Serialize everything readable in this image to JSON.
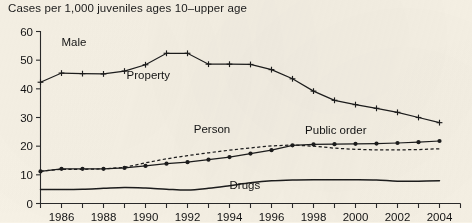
{
  "chart_data": {
    "type": "line",
    "title": "Cases per 1,000 juveniles ages 10–upper age",
    "subtitle": "Male",
    "xlabel": "",
    "ylabel": "",
    "xlim": [
      1985,
      2005
    ],
    "ylim": [
      0,
      60
    ],
    "yticks": [
      0,
      10,
      20,
      30,
      40,
      50,
      60
    ],
    "ytick_labels": [
      "0",
      "10",
      "20",
      "30",
      "40",
      "50",
      "60"
    ],
    "xticks": [
      1985,
      1986,
      1987,
      1988,
      1989,
      1990,
      1991,
      1992,
      1993,
      1994,
      1995,
      1996,
      1997,
      1998,
      1999,
      2000,
      2001,
      2002,
      2003,
      2004,
      2005
    ],
    "xtick_labels_shown": [
      "1986",
      "1988",
      "1990",
      "1992",
      "1994",
      "1996",
      "1998",
      "2000",
      "2002",
      "2004"
    ],
    "xtick_labels_years": [
      1986,
      1988,
      1990,
      1992,
      1994,
      1996,
      1998,
      2000,
      2002,
      2004
    ],
    "grid": false,
    "legend": "inline-annotations",
    "x": [
      1985,
      1986,
      1987,
      1988,
      1989,
      1990,
      1991,
      1992,
      1993,
      1994,
      1995,
      1996,
      1997,
      1998,
      1999,
      2000,
      2001,
      2002,
      2003,
      2004
    ],
    "series": [
      {
        "name": "Property",
        "label": "Property",
        "style": "solid",
        "marker": "plus",
        "label_x": 1989.1,
        "label_y": 43.5,
        "values": [
          42.3,
          45.5,
          45.3,
          45.2,
          46.2,
          48.4,
          52.4,
          52.4,
          48.6,
          48.6,
          48.5,
          46.7,
          43.5,
          39.2,
          36.0,
          34.5,
          33.2,
          31.8,
          30.0,
          28.2
        ]
      },
      {
        "name": "Person",
        "label": "Person",
        "style": "dashed",
        "marker": "none",
        "label_x": 1992.3,
        "label_y": 24.6,
        "values": [
          11.3,
          11.9,
          11.9,
          12.1,
          12.6,
          14.2,
          15.6,
          16.7,
          17.7,
          18.6,
          19.4,
          20.1,
          20.4,
          20.0,
          19.3,
          18.9,
          18.7,
          18.7,
          18.8,
          19.1
        ]
      },
      {
        "name": "Public order",
        "label": "Public order",
        "style": "solid",
        "marker": "dot",
        "label_x": 1997.6,
        "label_y": 24.3,
        "values": [
          11.2,
          12.1,
          12.1,
          12.1,
          12.4,
          13.1,
          13.9,
          14.4,
          15.3,
          16.2,
          17.4,
          18.6,
          20.3,
          20.6,
          20.7,
          20.8,
          20.9,
          21.1,
          21.4,
          21.8
        ]
      },
      {
        "name": "Drugs",
        "label": "Drugs",
        "style": "solid-smooth",
        "marker": "none",
        "label_x": 1994.0,
        "label_y": 5.1,
        "values": [
          4.9,
          4.9,
          5.0,
          5.3,
          5.6,
          5.4,
          5.0,
          4.7,
          5.3,
          6.2,
          7.2,
          7.9,
          8.2,
          8.3,
          8.3,
          8.3,
          8.2,
          7.8,
          7.8,
          7.9
        ]
      }
    ]
  }
}
